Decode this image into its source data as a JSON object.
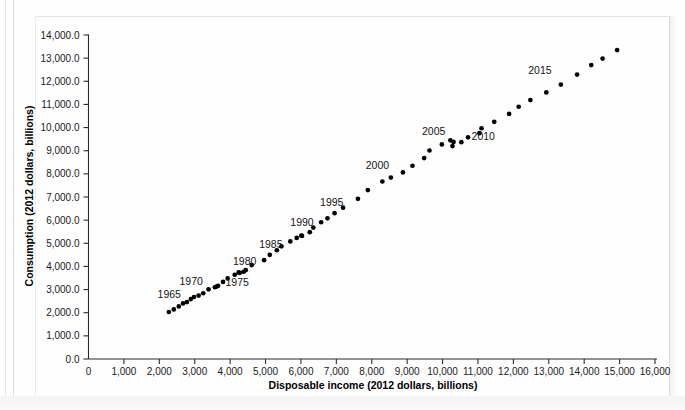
{
  "figure": {
    "title": "",
    "x_axis_title": "Disposable income (2012 dollars, billions)",
    "y_axis_title": "Consumption (2012 dollars, billions)"
  },
  "chart_data": {
    "type": "scatter",
    "title": "",
    "xlabel": "Disposable income (2012 dollars, billions)",
    "ylabel": "Consumption (2012 dollars, billions)",
    "xlim": [
      0,
      16000
    ],
    "ylim": [
      0,
      14000
    ],
    "xticks": [
      0,
      1000,
      2000,
      3000,
      4000,
      5000,
      6000,
      7000,
      8000,
      9000,
      10000,
      11000,
      12000,
      13000,
      14000,
      15000,
      16000
    ],
    "xtick_labels": [
      "0",
      "1,000",
      "2,000",
      "3,000",
      "4,000",
      "5,000",
      "6,000",
      "7,000",
      "8,000",
      "9,000",
      "10,000",
      "11,000",
      "12,000",
      "13,000",
      "14,000",
      "15,000",
      "16,000"
    ],
    "yticks": [
      0,
      1000,
      2000,
      3000,
      4000,
      5000,
      6000,
      7000,
      8000,
      9000,
      10000,
      11000,
      12000,
      13000,
      14000
    ],
    "ytick_labels": [
      "0.0",
      "1,000.0",
      "2,000.0",
      "3,000.0",
      "4,000.0",
      "5,000.0",
      "6,000.0",
      "7,000.0",
      "8,000.0",
      "9,000.0",
      "10,000.0",
      "11,000.0",
      "12,000.0",
      "13,000.0",
      "14,000.0"
    ],
    "grid": false,
    "legend": "none",
    "marker": "filled-circle",
    "marker_color": "#000000",
    "points": [
      {
        "year": 1963,
        "x": 2270,
        "y": 2030
      },
      {
        "year": 1964,
        "x": 2410,
        "y": 2140
      },
      {
        "year": 1965,
        "x": 2550,
        "y": 2270
      },
      {
        "year": 1966,
        "x": 2670,
        "y": 2400
      },
      {
        "year": 1967,
        "x": 2780,
        "y": 2460
      },
      {
        "year": 1968,
        "x": 2890,
        "y": 2590
      },
      {
        "year": 1969,
        "x": 2980,
        "y": 2680
      },
      {
        "year": 1970,
        "x": 3110,
        "y": 2740
      },
      {
        "year": 1971,
        "x": 3240,
        "y": 2840
      },
      {
        "year": 1972,
        "x": 3390,
        "y": 3010
      },
      {
        "year": 1973,
        "x": 3610,
        "y": 3130
      },
      {
        "year": 1974,
        "x": 3570,
        "y": 3100
      },
      {
        "year": 1975,
        "x": 3660,
        "y": 3160
      },
      {
        "year": 1976,
        "x": 3800,
        "y": 3330
      },
      {
        "year": 1977,
        "x": 3930,
        "y": 3480
      },
      {
        "year": 1978,
        "x": 4130,
        "y": 3640
      },
      {
        "year": 1979,
        "x": 4240,
        "y": 3740
      },
      {
        "year": 1980,
        "x": 4270,
        "y": 3720
      },
      {
        "year": 1981,
        "x": 4380,
        "y": 3770
      },
      {
        "year": 1982,
        "x": 4440,
        "y": 3840
      },
      {
        "year": 1983,
        "x": 4610,
        "y": 4060
      },
      {
        "year": 1984,
        "x": 4960,
        "y": 4270
      },
      {
        "year": 1985,
        "x": 5120,
        "y": 4500
      },
      {
        "year": 1986,
        "x": 5320,
        "y": 4700
      },
      {
        "year": 1987,
        "x": 5450,
        "y": 4870
      },
      {
        "year": 1988,
        "x": 5700,
        "y": 5080
      },
      {
        "year": 1989,
        "x": 5880,
        "y": 5230
      },
      {
        "year": 1990,
        "x": 6010,
        "y": 5330
      },
      {
        "year": 1991,
        "x": 6030,
        "y": 5320
      },
      {
        "year": 1992,
        "x": 6250,
        "y": 5480
      },
      {
        "year": 1993,
        "x": 6350,
        "y": 5680
      },
      {
        "year": 1994,
        "x": 6570,
        "y": 5910
      },
      {
        "year": 1995,
        "x": 6750,
        "y": 6080
      },
      {
        "year": 1996,
        "x": 6950,
        "y": 6300
      },
      {
        "year": 1997,
        "x": 7190,
        "y": 6540
      },
      {
        "year": 1998,
        "x": 7610,
        "y": 6920
      },
      {
        "year": 1999,
        "x": 7890,
        "y": 7300
      },
      {
        "year": 2000,
        "x": 8300,
        "y": 7670
      },
      {
        "year": 2001,
        "x": 8540,
        "y": 7840
      },
      {
        "year": 2002,
        "x": 8880,
        "y": 8060
      },
      {
        "year": 2003,
        "x": 9150,
        "y": 8350
      },
      {
        "year": 2004,
        "x": 9480,
        "y": 8680
      },
      {
        "year": 2005,
        "x": 9630,
        "y": 9010
      },
      {
        "year": 2006,
        "x": 9980,
        "y": 9270
      },
      {
        "year": 2007,
        "x": 10220,
        "y": 9450
      },
      {
        "year": 2008,
        "x": 10310,
        "y": 9380
      },
      {
        "year": 2009,
        "x": 10280,
        "y": 9200
      },
      {
        "year": 2010,
        "x": 10530,
        "y": 9370
      },
      {
        "year": 2011,
        "x": 10720,
        "y": 9580
      },
      {
        "year": 2012,
        "x": 11040,
        "y": 9760
      },
      {
        "year": 2013,
        "x": 11100,
        "y": 9970
      },
      {
        "year": 2014,
        "x": 11460,
        "y": 10250
      },
      {
        "year": 2015,
        "x": 11880,
        "y": 10590
      },
      {
        "year": 2016,
        "x": 12150,
        "y": 10900
      },
      {
        "year": 2017,
        "x": 12480,
        "y": 11190
      },
      {
        "year": 2018,
        "x": 12930,
        "y": 11520
      },
      {
        "year": 2019,
        "x": 13340,
        "y": 11860
      },
      {
        "year": 2020,
        "x": 13800,
        "y": 12290
      },
      {
        "year": 2021,
        "x": 14200,
        "y": 12700
      },
      {
        "year": 2022,
        "x": 14520,
        "y": 12980
      },
      {
        "year": 2023,
        "x": 14930,
        "y": 13350
      }
    ],
    "annotations": [
      {
        "text": "1965",
        "x": 2280,
        "y": 2640
      },
      {
        "text": "1970",
        "x": 2900,
        "y": 3180
      },
      {
        "text": "1975",
        "x": 4200,
        "y": 3170
      },
      {
        "text": "1980",
        "x": 4410,
        "y": 4060
      },
      {
        "text": "1985",
        "x": 5150,
        "y": 4790
      },
      {
        "text": "1990",
        "x": 6030,
        "y": 5750
      },
      {
        "text": "1995",
        "x": 6870,
        "y": 6620
      },
      {
        "text": "2000",
        "x": 8160,
        "y": 8200
      },
      {
        "text": "2005",
        "x": 9750,
        "y": 9700
      },
      {
        "text": "2010",
        "x": 11150,
        "y": 9470
      },
      {
        "text": "2015",
        "x": 12750,
        "y": 12320
      }
    ]
  }
}
